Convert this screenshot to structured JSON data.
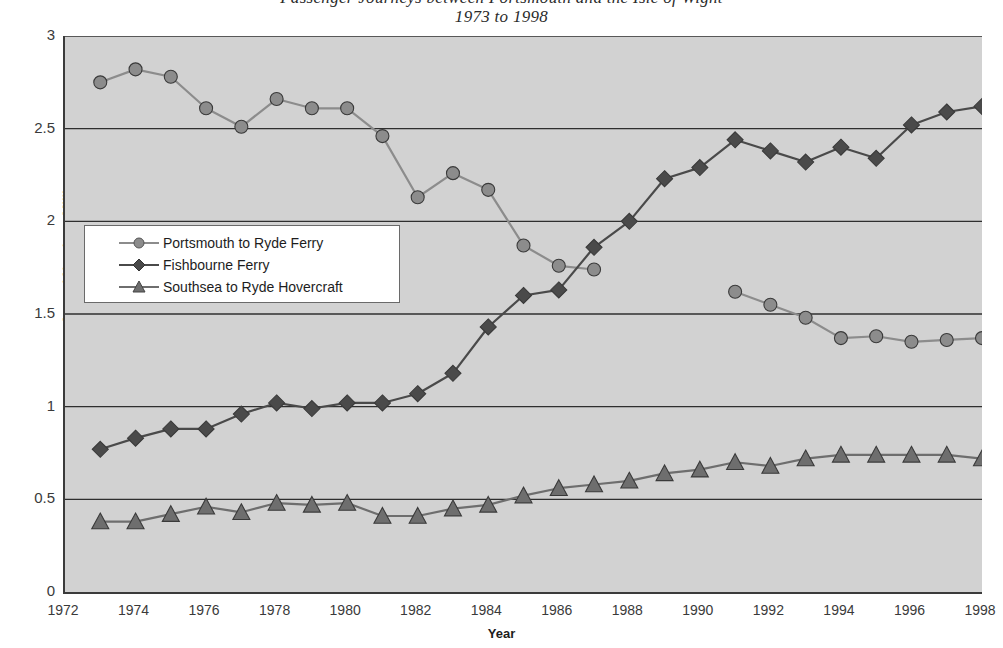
{
  "title": {
    "main": "Passenger Journeys between Portsmouth and the Isle of Wight",
    "sub": "1973 to 1998"
  },
  "axes": {
    "y_title": "Annual Number - Millions",
    "x_title": "Year",
    "y_ticks": [
      "0",
      "0.5",
      "1",
      "1.5",
      "2",
      "2.5",
      "3"
    ],
    "x_ticks": [
      "1972",
      "1974",
      "1976",
      "1978",
      "1980",
      "1982",
      "1984",
      "1986",
      "1988",
      "1990",
      "1992",
      "1994",
      "1996",
      "1998"
    ]
  },
  "legend": {
    "items": [
      {
        "label": "Portsmouth to Ryde Ferry",
        "marker": "circle",
        "color": "#8c8c8c"
      },
      {
        "label": "Fishbourne Ferry",
        "marker": "diamond",
        "color": "#4a4a4a"
      },
      {
        "label": "Southsea to Ryde Hovercraft",
        "marker": "triangle",
        "color": "#6e6e6e"
      }
    ]
  },
  "style": {
    "plot_background": "#d2d2d2",
    "axis_color": "#3b3b3b",
    "gridline_color": "#2f2f2f",
    "series_portsmouth": "#8c8c8c",
    "series_fishbourne": "#4a4a4a",
    "series_hovercraft": "#6e6e6e"
  },
  "chart_data": {
    "type": "line",
    "title": "Passenger Journeys between Portsmouth and the Isle of Wight",
    "subtitle": "1973 to 1998",
    "xlabel": "Year",
    "ylabel": "Annual Number - Millions",
    "xlim": [
      1972,
      1998
    ],
    "ylim": [
      0,
      3
    ],
    "ytick_step": 0.5,
    "xtick_step": 2,
    "grid": "horizontal",
    "legend_position": "inside-left",
    "x": [
      1973,
      1974,
      1975,
      1976,
      1977,
      1978,
      1979,
      1980,
      1981,
      1982,
      1983,
      1984,
      1985,
      1986,
      1987,
      1988,
      1989,
      1990,
      1991,
      1992,
      1993,
      1994,
      1995,
      1996,
      1997,
      1998
    ],
    "series": [
      {
        "name": "Portsmouth to Ryde Ferry",
        "marker": "circle",
        "color": "#8c8c8c",
        "values": [
          2.75,
          2.82,
          2.78,
          2.61,
          2.51,
          2.66,
          2.61,
          2.61,
          2.46,
          2.13,
          2.26,
          2.17,
          1.87,
          1.76,
          1.74,
          null,
          null,
          null,
          1.62,
          1.55,
          1.48,
          1.37,
          1.38,
          1.35,
          1.36,
          1.37
        ]
      },
      {
        "name": "Fishbourne Ferry",
        "marker": "diamond",
        "color": "#4a4a4a",
        "values": [
          0.77,
          0.83,
          0.88,
          0.88,
          0.96,
          1.02,
          0.99,
          1.02,
          1.02,
          1.07,
          1.18,
          1.43,
          1.6,
          1.63,
          1.86,
          2.0,
          2.23,
          2.29,
          2.44,
          2.38,
          2.32,
          2.4,
          2.34,
          2.52,
          2.59,
          2.62
        ]
      },
      {
        "name": "Southsea to Ryde Hovercraft",
        "marker": "triangle",
        "color": "#6e6e6e",
        "values": [
          0.38,
          0.38,
          0.42,
          0.46,
          0.43,
          0.48,
          0.47,
          0.48,
          0.41,
          0.41,
          0.45,
          0.47,
          0.52,
          0.56,
          0.58,
          0.6,
          0.64,
          0.66,
          0.7,
          0.68,
          0.72,
          0.74,
          0.74,
          0.74,
          0.74,
          0.72
        ]
      }
    ]
  }
}
